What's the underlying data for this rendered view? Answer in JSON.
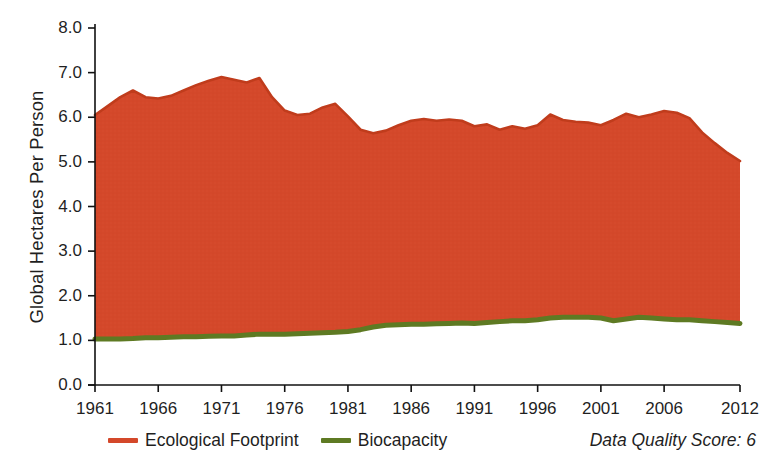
{
  "chart_data": {
    "type": "area",
    "title": "",
    "xlabel": "",
    "ylabel": "Global Hectares Per Person",
    "ylim": [
      0.0,
      8.0
    ],
    "xlim": [
      1961,
      2012
    ],
    "grid": false,
    "legend_position": "bottom-left",
    "ytick_labels": [
      "8.0",
      "7.0",
      "6.0",
      "5.0",
      "4.0",
      "3.0",
      "2.0",
      "1.0",
      "0.0"
    ],
    "ytick_values": [
      8.0,
      7.0,
      6.0,
      5.0,
      4.0,
      3.0,
      2.0,
      1.0,
      0.0
    ],
    "xtick_labels": [
      "1961",
      "1966",
      "1971",
      "1976",
      "1981",
      "1986",
      "1991",
      "1996",
      "2001",
      "2006",
      "2012"
    ],
    "xtick_values": [
      1961,
      1966,
      1971,
      1976,
      1981,
      1986,
      1991,
      1996,
      2001,
      2006,
      2012
    ],
    "x": [
      1961,
      1962,
      1963,
      1964,
      1965,
      1966,
      1967,
      1968,
      1969,
      1970,
      1971,
      1972,
      1973,
      1974,
      1975,
      1976,
      1977,
      1978,
      1979,
      1980,
      1981,
      1982,
      1983,
      1984,
      1985,
      1986,
      1987,
      1988,
      1989,
      1990,
      1991,
      1992,
      1993,
      1994,
      1995,
      1996,
      1997,
      1998,
      1999,
      2000,
      2001,
      2002,
      2003,
      2004,
      2005,
      2006,
      2007,
      2008,
      2009,
      2010,
      2011,
      2012
    ],
    "series": [
      {
        "name": "Ecological Footprint",
        "color": "#D4482A",
        "values": [
          6.05,
          6.25,
          6.45,
          6.6,
          6.45,
          6.42,
          6.48,
          6.6,
          6.72,
          6.82,
          6.9,
          6.84,
          6.78,
          6.88,
          6.45,
          6.15,
          6.05,
          6.08,
          6.22,
          6.3,
          6.02,
          5.72,
          5.64,
          5.7,
          5.82,
          5.92,
          5.96,
          5.92,
          5.95,
          5.92,
          5.8,
          5.84,
          5.72,
          5.8,
          5.74,
          5.82,
          6.06,
          5.94,
          5.9,
          5.88,
          5.82,
          5.94,
          6.08,
          6.0,
          6.06,
          6.14,
          6.1,
          5.98,
          5.66,
          5.42,
          5.2,
          5.02
        ]
      },
      {
        "name": "Biocapacity",
        "color": "#5E7A23",
        "values": [
          1.03,
          1.03,
          1.03,
          1.04,
          1.06,
          1.06,
          1.07,
          1.08,
          1.08,
          1.09,
          1.1,
          1.1,
          1.12,
          1.14,
          1.14,
          1.14,
          1.15,
          1.16,
          1.17,
          1.18,
          1.2,
          1.24,
          1.3,
          1.34,
          1.35,
          1.36,
          1.36,
          1.37,
          1.38,
          1.39,
          1.38,
          1.4,
          1.42,
          1.44,
          1.44,
          1.46,
          1.5,
          1.52,
          1.52,
          1.52,
          1.5,
          1.44,
          1.48,
          1.52,
          1.5,
          1.48,
          1.46,
          1.46,
          1.44,
          1.42,
          1.4,
          1.38
        ]
      }
    ],
    "annotations": [
      {
        "name": "data-quality-score",
        "text": "Data Quality Score: 6"
      }
    ]
  },
  "legend": {
    "items": [
      {
        "label": "Ecological Footprint",
        "color": "#D4482A"
      },
      {
        "label": "Biocapacity",
        "color": "#5E7A23"
      }
    ]
  },
  "footer": {
    "data_quality_score": "Data Quality Score: 6"
  }
}
